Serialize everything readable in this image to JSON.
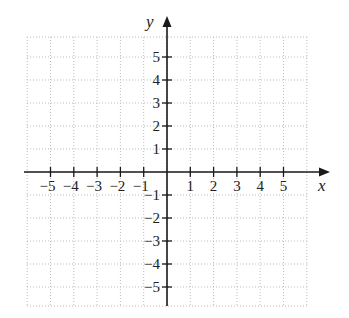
{
  "chart_data": {
    "type": "scatter",
    "title": "",
    "xlabel": "x",
    "ylabel": "y",
    "xlim": [
      -6,
      6
    ],
    "ylim": [
      -6,
      6
    ],
    "grid": true,
    "grid_style": "dotted",
    "x_ticks": [
      -5,
      -4,
      -3,
      -2,
      -1,
      1,
      2,
      3,
      4,
      5
    ],
    "y_ticks": [
      -5,
      -4,
      -3,
      -2,
      -1,
      1,
      2,
      3,
      4,
      5
    ],
    "x_tick_labels": [
      "−5",
      "−4",
      "−3",
      "−2",
      "−1",
      "1",
      "2",
      "3",
      "4",
      "5"
    ],
    "y_tick_labels": [
      "−5",
      "−4",
      "−3",
      "−2",
      "−1",
      "1",
      "2",
      "3",
      "4",
      "5"
    ],
    "series": [],
    "legend": null
  },
  "colors": {
    "axis": "#1a1a1a",
    "grid": "#bdbdbd",
    "text": "#222222"
  },
  "layout": {
    "origin_x": 167,
    "origin_y": 172,
    "unit_x": 23.3,
    "unit_y": 23,
    "grid_left": 27,
    "grid_right": 308,
    "grid_top": 37,
    "grid_bottom": 306,
    "x_axis_end": 330,
    "y_axis_top": 16
  }
}
